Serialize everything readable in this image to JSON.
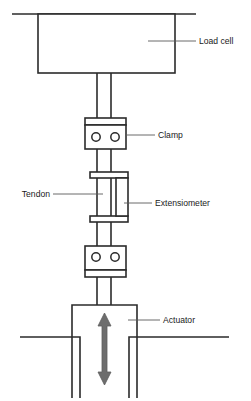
{
  "diagram": {
    "type": "schematic",
    "background_color": "#ffffff",
    "line_color": "#2b2b2b",
    "text_color": "#1a1a1a",
    "arrow_color": "#6d6d6d"
  },
  "labels": {
    "load_cell": "Load cell",
    "clamp": "Clamp",
    "tendon": "Tendon",
    "extensiometer": "Extensiometer",
    "actuator": "Actuator"
  },
  "components": [
    {
      "name": "load-cell",
      "label": "Load cell",
      "shape": "rectangle",
      "position": "top",
      "leader_side": "right"
    },
    {
      "name": "upper-rod",
      "label": "",
      "shape": "vertical-rod",
      "position": "below-load-cell",
      "leader_side": "none"
    },
    {
      "name": "upper-clamp",
      "label": "Clamp",
      "shape": "clamp-block-two-holes",
      "position": "upper-middle",
      "leader_side": "right"
    },
    {
      "name": "tendon",
      "label": "Tendon",
      "shape": "vertical-rod",
      "position": "middle",
      "leader_side": "left"
    },
    {
      "name": "extensiometer",
      "label": "Extensiometer",
      "shape": "slender-vertical-box",
      "position": "middle-right-of-tendon",
      "leader_side": "right"
    },
    {
      "name": "lower-clamp",
      "label": "",
      "shape": "clamp-block-two-holes",
      "position": "lower-middle",
      "leader_side": "none"
    },
    {
      "name": "actuator",
      "label": "Actuator",
      "shape": "rectangle-with-double-arrow",
      "position": "bottom",
      "leader_side": "right"
    }
  ],
  "arrow": {
    "name": "double-headed-arrow",
    "direction": "vertical-bidirectional",
    "meaning": "actuator stroke"
  }
}
